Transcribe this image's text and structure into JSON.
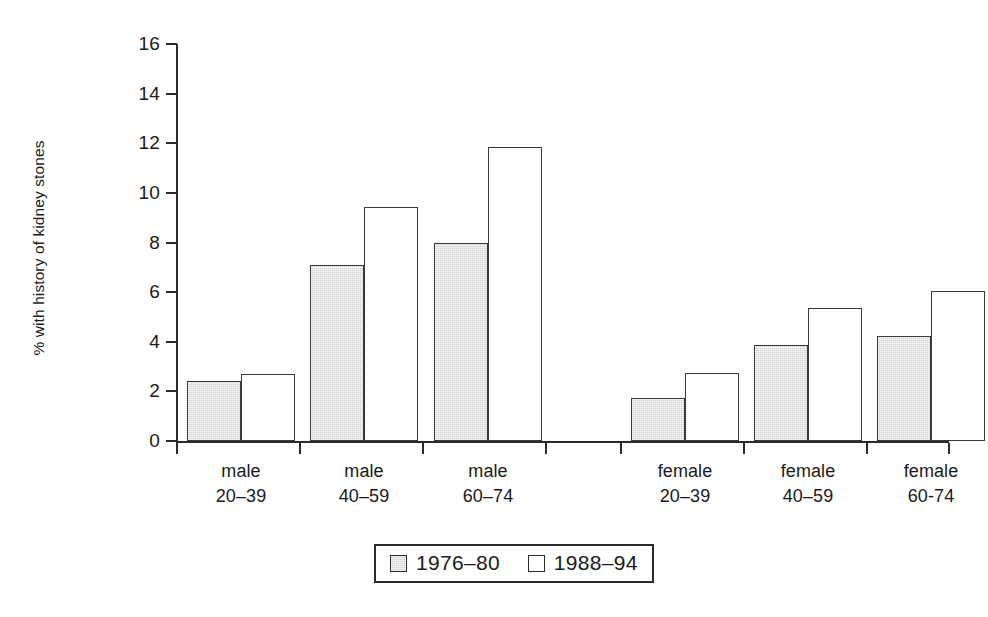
{
  "chart_data": {
    "type": "bar",
    "title": "",
    "subtitle": "",
    "xlabel": "",
    "ylabel": "% with history of kidney stones",
    "ylabel_lines": [
      "% with history",
      "of kidney stones"
    ],
    "ylim": [
      0,
      16
    ],
    "ytick_values": [
      0,
      2,
      4,
      6,
      8,
      10,
      12,
      14,
      16
    ],
    "ytick_labels": [
      "0",
      "2",
      "4",
      "6",
      "8",
      "10",
      "12",
      "14",
      "16"
    ],
    "grid": false,
    "legend_position": "bottom-center",
    "categories": [
      "male 20–39",
      "male 40–59",
      "male 60–74",
      "female 20–39",
      "female 40–59",
      "female 60-74"
    ],
    "category_lines": [
      [
        "male",
        "20–39"
      ],
      [
        "male",
        "40–59"
      ],
      [
        "male",
        "60–74"
      ],
      [
        "female",
        "20–39"
      ],
      [
        "female",
        "40–59"
      ],
      [
        "female",
        "60-74"
      ]
    ],
    "series": [
      {
        "name": "1976–80",
        "color": "#d2d2d2",
        "values": [
          2.4,
          7.1,
          8.0,
          1.75,
          3.85,
          4.25
        ]
      },
      {
        "name": "1988–94",
        "color": "#ffffff",
        "values": [
          2.7,
          9.45,
          11.85,
          2.75,
          5.35,
          6.05
        ]
      }
    ],
    "annotations": []
  },
  "legend": {
    "items": [
      {
        "label": "1976–80",
        "swatch": "grey"
      },
      {
        "label": "1988–94",
        "swatch": "white"
      }
    ]
  },
  "colors": {
    "axis": "#2b2b2b",
    "bar_outline": "#3a3a3a",
    "series_1976_80": "#d2d2d2",
    "series_1988_94": "#ffffff",
    "text": "#1a1a1a"
  }
}
